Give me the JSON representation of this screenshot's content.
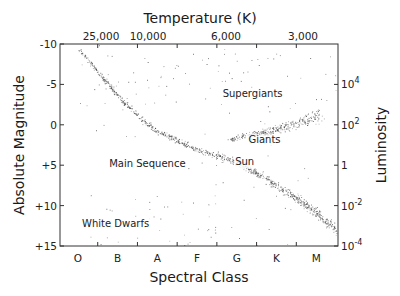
{
  "chart_data": {
    "type": "scatter",
    "xlabel": "Spectral Class",
    "ylabel": "Absolute Magnitude",
    "x2label": "Temperature (K)",
    "y2label": "Luminosity",
    "x_categories": [
      "O",
      "B",
      "A",
      "F",
      "G",
      "K",
      "M"
    ],
    "x2_ticks": [
      "25,000",
      "10,000",
      "6,000",
      "3,000"
    ],
    "y_ticks": [
      "-10",
      "-5",
      "0",
      "+5",
      "+10",
      "+15"
    ],
    "y_values": [
      -10,
      -5,
      0,
      5,
      10,
      15
    ],
    "ylim": [
      -10,
      15
    ],
    "y_inverted": true,
    "y2_ticks": [
      {
        "base": "10",
        "exp": "4",
        "mag": -5
      },
      {
        "base": "10",
        "exp": "2",
        "mag": 0
      },
      {
        "base": "1",
        "exp": "",
        "mag": 5
      },
      {
        "base": "10",
        "exp": "-2",
        "mag": 10
      },
      {
        "base": "10",
        "exp": "-4",
        "mag": 15
      }
    ],
    "annotations": [
      {
        "text": "Supergiants",
        "class_pos": 4.4,
        "mag": -3.5
      },
      {
        "text": "Giants",
        "class_pos": 4.7,
        "mag": 2.3
      },
      {
        "text": "Main Sequence",
        "class_pos": 1.75,
        "mag": 5.2
      },
      {
        "text": "Sun",
        "class_pos": 4.2,
        "mag": 5.0
      },
      {
        "text": "White Dwarfs",
        "class_pos": 0.95,
        "mag": 12.6
      }
    ],
    "series": [
      {
        "name": "Main Sequence",
        "count": 900,
        "path": [
          [
            0.0,
            -9.5
          ],
          [
            0.6,
            -6.0
          ],
          [
            1.2,
            -2.5
          ],
          [
            2.0,
            0.8
          ],
          [
            3.0,
            3.0
          ],
          [
            4.0,
            4.6
          ],
          [
            4.6,
            6.2
          ],
          [
            5.4,
            8.8
          ],
          [
            6.0,
            10.8
          ],
          [
            6.6,
            13.5
          ]
        ],
        "spread": 0.65
      },
      {
        "name": "Giants",
        "count": 300,
        "path": [
          [
            3.8,
            1.8
          ],
          [
            4.6,
            1.0
          ],
          [
            5.3,
            0.2
          ],
          [
            6.1,
            -1.2
          ]
        ],
        "spread": 0.9
      },
      {
        "name": "Supergiants",
        "count": 60,
        "box": [
          0.5,
          -9.5,
          6.8,
          -2.0
        ]
      },
      {
        "name": "White Dwarfs",
        "count": 30,
        "box": [
          0.3,
          8.5,
          3.5,
          14.0
        ]
      },
      {
        "name": "Field",
        "count": 80,
        "box": [
          0.0,
          -10,
          7.0,
          15
        ]
      }
    ]
  }
}
